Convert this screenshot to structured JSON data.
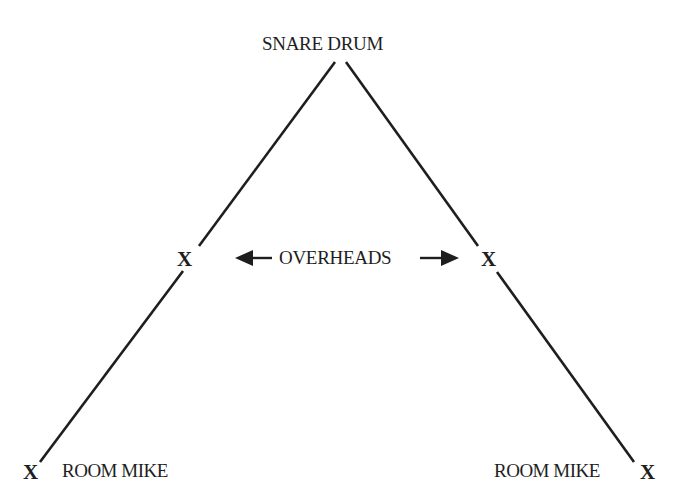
{
  "diagram": {
    "type": "microphone-placement",
    "labels": {
      "source": "SNARE DRUM",
      "overheads": "OVERHEADS",
      "room_left": "ROOM MIKE",
      "room_right": "ROOM MIKE"
    },
    "markers": {
      "overhead_left": "X",
      "overhead_right": "X",
      "room_left": "X",
      "room_right": "X"
    },
    "colors": {
      "ink": "#1e1e1e",
      "background": "#ffffff"
    }
  }
}
